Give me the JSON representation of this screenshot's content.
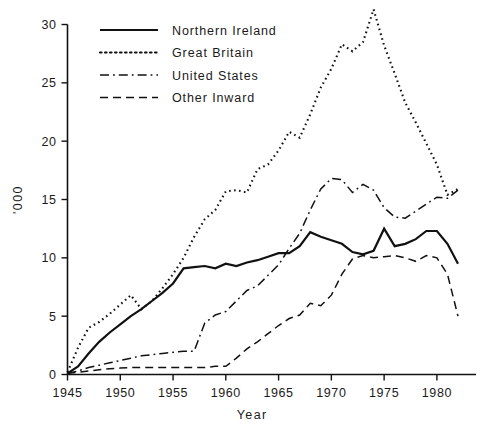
{
  "chart_data": {
    "type": "line",
    "title": "",
    "subtitle": "",
    "xlabel": "Year",
    "ylabel": "'000",
    "xlim": [
      1945,
      1982
    ],
    "ylim": [
      0,
      30
    ],
    "xticks": [
      1945,
      1950,
      1955,
      1960,
      1965,
      1970,
      1975,
      1980
    ],
    "yticks": [
      0,
      5,
      10,
      15,
      20,
      25,
      30
    ],
    "grid": false,
    "legend_position": "top-left-inside",
    "x": [
      1945,
      1946,
      1947,
      1948,
      1949,
      1950,
      1951,
      1952,
      1953,
      1954,
      1955,
      1956,
      1957,
      1958,
      1959,
      1960,
      1961,
      1962,
      1963,
      1964,
      1965,
      1966,
      1967,
      1968,
      1969,
      1970,
      1971,
      1972,
      1973,
      1974,
      1975,
      1976,
      1977,
      1978,
      1979,
      1980,
      1981,
      1982
    ],
    "series": [
      {
        "name": "Northern Ireland",
        "style": "solid",
        "values": [
          0.1,
          0.7,
          1.8,
          2.8,
          3.6,
          4.3,
          5.0,
          5.6,
          6.3,
          7.0,
          7.8,
          9.1,
          9.2,
          9.3,
          9.1,
          9.5,
          9.3,
          9.6,
          9.8,
          10.1,
          10.4,
          10.4,
          11.0,
          12.2,
          11.8,
          11.5,
          11.2,
          10.5,
          10.3,
          10.6,
          12.5,
          11.0,
          11.2,
          11.6,
          12.3,
          12.3,
          11.2,
          9.5
        ]
      },
      {
        "name": "Great Britain",
        "style": "dotted",
        "values": [
          0.2,
          2.3,
          4.0,
          4.5,
          5.2,
          6.0,
          6.8,
          5.6,
          6.3,
          7.4,
          8.6,
          10.0,
          11.8,
          13.3,
          14.1,
          15.7,
          15.8,
          15.6,
          17.6,
          18.0,
          19.2,
          20.8,
          20.3,
          22.3,
          24.6,
          26.2,
          28.3,
          27.7,
          28.5,
          31.3,
          28.2,
          25.8,
          23.3,
          21.6,
          19.8,
          18.0,
          15.4,
          15.9
        ]
      },
      {
        "name": "United States",
        "style": "dashdot",
        "values": [
          0.1,
          0.3,
          0.6,
          0.8,
          1.0,
          1.2,
          1.4,
          1.6,
          1.7,
          1.8,
          1.9,
          2.0,
          2.0,
          4.4,
          5.1,
          5.4,
          6.3,
          7.2,
          7.6,
          8.5,
          9.4,
          10.8,
          12.1,
          14.1,
          15.9,
          16.8,
          16.7,
          15.6,
          16.3,
          15.8,
          14.3,
          13.5,
          13.4,
          14.0,
          14.6,
          15.2,
          15.1,
          15.8
        ]
      },
      {
        "name": "Other Inward",
        "style": "dashed",
        "values": [
          0.1,
          0.2,
          0.3,
          0.4,
          0.5,
          0.55,
          0.6,
          0.6,
          0.6,
          0.6,
          0.6,
          0.6,
          0.6,
          0.6,
          0.7,
          0.7,
          1.4,
          2.2,
          2.8,
          3.5,
          4.2,
          4.8,
          5.1,
          6.1,
          5.9,
          6.8,
          8.6,
          9.9,
          10.2,
          10.0,
          10.1,
          10.2,
          10.0,
          9.7,
          10.2,
          10.0,
          8.6,
          5.0
        ]
      }
    ]
  },
  "axis": {
    "x_tick_labels": [
      "1945",
      "1950",
      "1955",
      "1960",
      "1965",
      "1970",
      "1975",
      "1980"
    ],
    "y_tick_labels": [
      "0",
      "5",
      "10",
      "15",
      "20",
      "25",
      "30"
    ],
    "x_title": "Year",
    "y_title": "'000"
  },
  "legend": {
    "entries": [
      {
        "label": "Northern Ireland",
        "style": "solid"
      },
      {
        "label": "Great Britain",
        "style": "dotted"
      },
      {
        "label": "United States",
        "style": "dashdot"
      },
      {
        "label": "Other Inward",
        "style": "dashed"
      }
    ]
  }
}
